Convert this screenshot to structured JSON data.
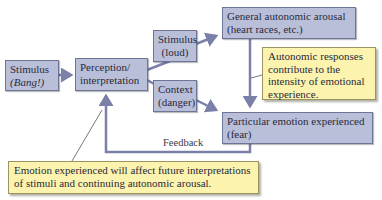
{
  "diagram": {
    "nodes": {
      "stimulus_bang": {
        "line1": "Stimulus",
        "line2": "(Bang!)"
      },
      "perception": {
        "line1": "Perception/",
        "line2": "interpretation"
      },
      "stimulus_loud": {
        "line1": "Stimulus",
        "line2": "(loud)"
      },
      "context": {
        "line1": "Context",
        "line2": "(danger)"
      },
      "general_arousal": {
        "line1": "General autonomic arousal",
        "line2": "(heart races, etc.)"
      },
      "particular_emotion": {
        "line1": "Particular emotion experienced",
        "line2": "(fear)"
      }
    },
    "callouts": {
      "autonomic": {
        "line1": "Autonomic responses",
        "line2": "contribute to the",
        "line3": "intensity of emotional",
        "line4": "experience."
      },
      "emotion": {
        "line1": "Emotion experienced will affect future interpretations",
        "line2": "of stimuli and continuing autonomic arousal."
      }
    },
    "edge_labels": {
      "feedback": "Feedback"
    },
    "colors": {
      "box_fill": "#b9bfd9",
      "box_border": "#6f7596",
      "callout_fill": "#fbf3ae",
      "arrow": "#7a80a8"
    }
  }
}
